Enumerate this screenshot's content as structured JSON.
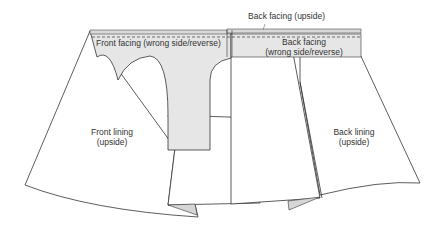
{
  "diagram": {
    "type": "sewing-construction",
    "labels": {
      "back_facing_upside": "Back facing (upside)",
      "front_facing": "Front facing (wrong side/reverse)",
      "back_facing_line1": "Back facing",
      "back_facing_line2": "(wrong side/reverse)",
      "front_lining_line1": "Front lining",
      "front_lining_line2": "(upside)",
      "back_lining_line1": "Back lining",
      "back_lining_line2": "(upside)"
    },
    "colors": {
      "stroke": "#333333",
      "facing_fill": "#e6e6e6",
      "band_fill": "#d9d9d9",
      "fold_fill": "#d6d6d6",
      "background": "#ffffff"
    }
  }
}
